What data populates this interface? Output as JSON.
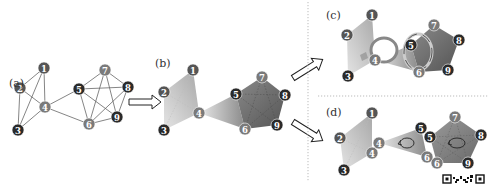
{
  "panels": {
    "a": {
      "label": "(a)"
    },
    "b": {
      "label": "(b)"
    },
    "c": {
      "label": "(c)"
    },
    "d": {
      "label": "(d)"
    }
  },
  "colors": {
    "node_dark": "#2a2a2a",
    "node_mid": "#555555",
    "node_light": "#7a7a7a",
    "edge": "#555555",
    "simplex_light": "#d8d8d8",
    "simplex_dark": "#6a6a6a",
    "divider": "#aaaaaa"
  },
  "graph_a": {
    "nodes": [
      {
        "id": "1",
        "x": 44,
        "y": 68,
        "shade": "mid"
      },
      {
        "id": "2",
        "x": 20,
        "y": 88,
        "shade": "mid"
      },
      {
        "id": "3",
        "x": 18,
        "y": 130,
        "shade": "dark"
      },
      {
        "id": "4",
        "x": 45,
        "y": 107,
        "shade": "light"
      },
      {
        "id": "5",
        "x": 79,
        "y": 89,
        "shade": "dark"
      },
      {
        "id": "6",
        "x": 89,
        "y": 124,
        "shade": "light"
      },
      {
        "id": "7",
        "x": 105,
        "y": 70,
        "shade": "light"
      },
      {
        "id": "8",
        "x": 128,
        "y": 87,
        "shade": "dark"
      },
      {
        "id": "9",
        "x": 117,
        "y": 117,
        "shade": "dark"
      }
    ],
    "edges": [
      [
        "1",
        "2"
      ],
      [
        "1",
        "4"
      ],
      [
        "1",
        "3"
      ],
      [
        "2",
        "4"
      ],
      [
        "2",
        "3"
      ],
      [
        "3",
        "4"
      ],
      [
        "4",
        "5"
      ],
      [
        "4",
        "6"
      ],
      [
        "5",
        "7"
      ],
      [
        "5",
        "8"
      ],
      [
        "5",
        "9"
      ],
      [
        "5",
        "6"
      ],
      [
        "6",
        "7"
      ],
      [
        "6",
        "8"
      ],
      [
        "6",
        "9"
      ],
      [
        "7",
        "8"
      ],
      [
        "7",
        "9"
      ],
      [
        "8",
        "9"
      ]
    ]
  },
  "graph_b": {
    "nodes": [
      {
        "id": "1",
        "x": 193,
        "y": 70,
        "shade": "mid"
      },
      {
        "id": "2",
        "x": 164,
        "y": 92,
        "shade": "mid"
      },
      {
        "id": "3",
        "x": 164,
        "y": 130,
        "shade": "dark"
      },
      {
        "id": "4",
        "x": 199,
        "y": 113,
        "shade": "light"
      },
      {
        "id": "5",
        "x": 236,
        "y": 94,
        "shade": "dark"
      },
      {
        "id": "6",
        "x": 245,
        "y": 129,
        "shade": "light"
      },
      {
        "id": "7",
        "x": 262,
        "y": 77,
        "shade": "light"
      },
      {
        "id": "8",
        "x": 285,
        "y": 95,
        "shade": "dark"
      },
      {
        "id": "9",
        "x": 277,
        "y": 125,
        "shade": "dark"
      }
    ]
  },
  "graph_c": {
    "nodes": [
      {
        "id": "1",
        "x": 372,
        "y": 15,
        "shade": "mid"
      },
      {
        "id": "2",
        "x": 347,
        "y": 35,
        "shade": "mid"
      },
      {
        "id": "3",
        "x": 348,
        "y": 76,
        "shade": "dark"
      },
      {
        "id": "4",
        "x": 375,
        "y": 60,
        "shade": "light"
      },
      {
        "id": "5",
        "x": 411,
        "y": 45,
        "shade": "dark"
      },
      {
        "id": "6",
        "x": 419,
        "y": 72,
        "shade": "light"
      },
      {
        "id": "7",
        "x": 434,
        "y": 25,
        "shade": "light"
      },
      {
        "id": "8",
        "x": 459,
        "y": 40,
        "shade": "dark"
      },
      {
        "id": "9",
        "x": 448,
        "y": 70,
        "shade": "dark"
      }
    ]
  },
  "graph_d": {
    "nodes": [
      {
        "id": "1",
        "x": 372,
        "y": 113,
        "shade": "mid"
      },
      {
        "id": "2",
        "x": 340,
        "y": 138,
        "shade": "mid"
      },
      {
        "id": "3",
        "x": 344,
        "y": 170,
        "shade": "dark"
      },
      {
        "id": "4",
        "x": 372,
        "y": 153,
        "shade": "light"
      },
      {
        "id": "4",
        "x": 379,
        "y": 143,
        "shade": "light"
      },
      {
        "id": "5",
        "x": 421,
        "y": 128,
        "shade": "dark"
      },
      {
        "id": "5",
        "x": 430,
        "y": 137,
        "shade": "dark"
      },
      {
        "id": "6",
        "x": 427,
        "y": 157,
        "shade": "light"
      },
      {
        "id": "6",
        "x": 437,
        "y": 163,
        "shade": "light"
      },
      {
        "id": "7",
        "x": 455,
        "y": 117,
        "shade": "light"
      },
      {
        "id": "8",
        "x": 481,
        "y": 135,
        "shade": "dark"
      },
      {
        "id": "9",
        "x": 468,
        "y": 163,
        "shade": "dark"
      }
    ]
  },
  "watermark": {
    "icon": "qr-code-icon"
  }
}
